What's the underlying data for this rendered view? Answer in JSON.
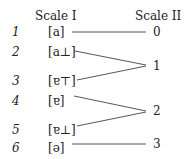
{
  "headers": {
    "scale1": "Scale I",
    "scale2": "Scale II"
  },
  "rows": [
    {
      "index": "1",
      "symbol": "[a]"
    },
    {
      "index": "2",
      "symbol": "[a⊥]"
    },
    {
      "index": "3",
      "symbol": "[ɐ⊤]"
    },
    {
      "index": "4",
      "symbol": "[ɐ]"
    },
    {
      "index": "5",
      "symbol": "[ɐ⊥]"
    },
    {
      "index": "6",
      "symbol": "[ə]"
    }
  ],
  "scale2_values": [
    "0",
    "1",
    "2",
    "3"
  ],
  "mapping": [
    {
      "from": "1",
      "to": "0"
    },
    {
      "from": "2",
      "to": "1"
    },
    {
      "from": "3",
      "to": "1"
    },
    {
      "from": "4",
      "to": "2"
    },
    {
      "from": "5",
      "to": "2"
    },
    {
      "from": "6",
      "to": "3"
    }
  ]
}
